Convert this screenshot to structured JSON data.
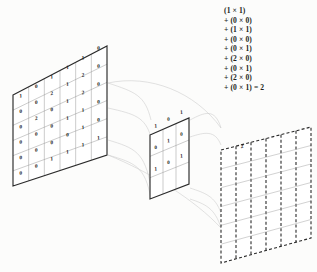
{
  "diagram": {
    "type": "cnn-convolution-illustration"
  },
  "equation": {
    "lines": [
      "(1 × 1)",
      "+ (0 × 0)",
      "+ (1 × 1)",
      "+ (0 × 0)",
      "+ (0 × 1)",
      "+ (2 × 0)",
      "+ (0 × 1)",
      "+ (2 × 0)",
      "+ (0 × 1) = 2"
    ],
    "result": "2"
  },
  "input_matrix": {
    "label": "input-feature-map",
    "rows": 6,
    "cols": 6,
    "values": [
      [
        1,
        0,
        1,
        1,
        1,
        0
      ],
      [
        0,
        0,
        2,
        1,
        2,
        0
      ],
      [
        0,
        2,
        0,
        1,
        2,
        0
      ],
      [
        0,
        0,
        0,
        1,
        1,
        0
      ],
      [
        0,
        0,
        0,
        0,
        1,
        0
      ],
      [
        0,
        0,
        1,
        1,
        1,
        1
      ]
    ]
  },
  "kernel_matrix": {
    "label": "convolution-kernel",
    "rows": 3,
    "cols": 3,
    "values": [
      [
        1,
        0,
        1
      ],
      [
        0,
        1,
        0
      ],
      [
        1,
        0,
        1
      ]
    ]
  },
  "output_matrix": {
    "label": "output-feature-map",
    "rows": 6,
    "cols": 6,
    "values": [
      [
        "",
        "",
        "",
        "",
        "",
        ""
      ],
      [
        "",
        "2",
        "",
        "",
        "",
        ""
      ],
      [
        "",
        "",
        "",
        "",
        "",
        ""
      ],
      [
        "",
        "",
        "",
        "",
        "",
        ""
      ],
      [
        "",
        "",
        "",
        "",
        "",
        ""
      ],
      [
        "",
        "",
        "",
        "",
        "",
        ""
      ]
    ],
    "highlight_value": "2",
    "highlight_row": 1,
    "highlight_col": 1
  },
  "colors": {
    "border": "#2b2b2b",
    "gridline": "#8d8d8d",
    "ray": "#c9c9c9",
    "text": "#231f20",
    "background": "#fcfcfb"
  }
}
